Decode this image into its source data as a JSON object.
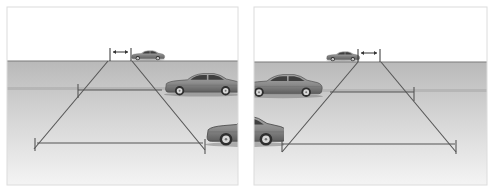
{
  "canvas": {
    "width": 494,
    "height": 194,
    "background": "#ffffff"
  },
  "colors": {
    "sky": "#ffffff",
    "road_top": "#b9b9b9",
    "road_mid": "#cfcfcf",
    "road_bottom": "#f2f2f2",
    "horizon": "#7a7a7a",
    "lane_streak": "#a8a8a8",
    "zone_line": "#555555",
    "panel_border": "#dcdcdc",
    "car_body": "#8a8a8a",
    "car_dark": "#4a4a4a",
    "car_window": "#3f3f3f",
    "wheel": "#2e2e2e",
    "rim": "#d8d8d8"
  },
  "panels": [
    {
      "id": "left",
      "box": {
        "x": 7,
        "y": 7,
        "w": 231,
        "h": 178
      },
      "horizon_y": 61,
      "streak_y": 88,
      "far_markers": {
        "x1": 110,
        "x2": 131,
        "y_top": 48,
        "y_bottom": 61,
        "arrow_y": 52
      },
      "zone": {
        "left_edge": {
          "x1": 108,
          "y1": 61,
          "x2": 34,
          "y2": 149
        },
        "right_edge": {
          "x1": 132,
          "y1": 61,
          "x2": 205,
          "y2": 150
        },
        "mid_line": {
          "x1": 78,
          "x2": 162,
          "y": 90
        },
        "bottom_line": {
          "x1": 37,
          "x2": 203,
          "y": 143
        },
        "ticks": [
          {
            "x": 78,
            "y1": 84,
            "y2": 98
          },
          {
            "x": 35,
            "y1": 138,
            "y2": 151
          },
          {
            "x": 205,
            "y1": 139,
            "y2": 154
          }
        ]
      },
      "cars": [
        {
          "name": "far-car",
          "x": 131,
          "y": 50,
          "scale": 0.34,
          "facing": "right",
          "clip": null
        },
        {
          "name": "near-car",
          "x": 164,
          "y": 72,
          "scale": 0.78,
          "facing": "right",
          "clip": {
            "x": 164,
            "w": 74
          }
        },
        {
          "name": "closest-car-front",
          "x": 205,
          "y": 114,
          "scale": 1.05,
          "facing": "right",
          "clip": {
            "x": 205,
            "w": 33
          }
        }
      ]
    },
    {
      "id": "right",
      "box": {
        "x": 254,
        "y": 7,
        "w": 233,
        "h": 178
      },
      "horizon_y": 62,
      "streak_y": 90,
      "far_markers": {
        "x1": 358,
        "x2": 380,
        "y_top": 49,
        "y_bottom": 62,
        "arrow_y": 53
      },
      "zone": {
        "left_edge": {
          "x1": 358,
          "y1": 62,
          "x2": 282,
          "y2": 152
        },
        "right_edge": {
          "x1": 381,
          "y1": 62,
          "x2": 456,
          "y2": 152
        },
        "mid_line": {
          "x1": 330,
          "x2": 414,
          "y": 92
        },
        "bottom_line": {
          "x1": 282,
          "x2": 455,
          "y": 144
        },
        "ticks": [
          {
            "x": 414,
            "y1": 87,
            "y2": 101
          },
          {
            "x": 282,
            "y1": 140,
            "y2": 152
          },
          {
            "x": 456,
            "y1": 140,
            "y2": 154
          }
        ]
      },
      "cars": [
        {
          "name": "far-car",
          "x": 326,
          "y": 51,
          "scale": 0.34,
          "facing": "right",
          "clip": null
        },
        {
          "name": "near-car",
          "x": 243,
          "y": 73,
          "scale": 0.8,
          "facing": "right",
          "clip": {
            "x": 254,
            "w": 80
          }
        },
        {
          "name": "closest-car-rear",
          "x": 183,
          "y": 114,
          "scale": 1.05,
          "facing": "right",
          "clip": {
            "x": 254,
            "w": 30
          }
        }
      ]
    }
  ]
}
